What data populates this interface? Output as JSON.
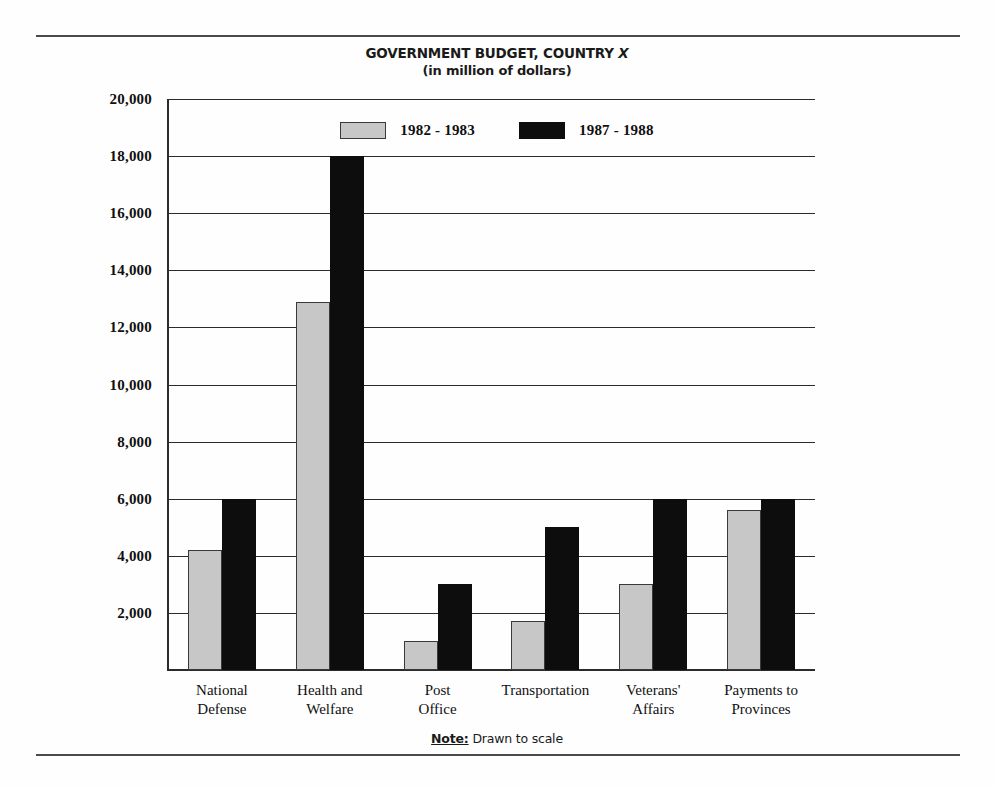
{
  "figure": {
    "title": "GOVERNMENT BUDGET, COUNTRY ",
    "title_variable": "X",
    "subtitle": "(in million of dollars)",
    "note_key": "Note:",
    "note_text": " Drawn to scale"
  },
  "colors": {
    "series_1982_1983": "#c7c7c7",
    "series_1987_1988": "#0d0d0d",
    "axis": "#2b2b2b",
    "rule": "#4a4a4a",
    "text": "#101010",
    "background": "#fefefe"
  },
  "legend": {
    "position": "top-center",
    "entries": [
      {
        "label": "1982 - 1983",
        "color": "#c7c7c7"
      },
      {
        "label": "1987 - 1988",
        "color": "#0d0d0d"
      }
    ]
  },
  "chart_data": {
    "type": "bar",
    "title": "GOVERNMENT BUDGET, COUNTRY X",
    "subtitle": "(in million of dollars)",
    "xlabel": "",
    "ylabel": "",
    "ylim": [
      0,
      20000
    ],
    "ytick_step": 2000,
    "grid": true,
    "legend_position": "top-center",
    "note": "Note: Drawn to scale",
    "units": "million of dollars",
    "categories": [
      "National Defense",
      "Health and Welfare",
      "Post Office",
      "Transportation",
      "Veterans' Affairs",
      "Payments to Provinces"
    ],
    "category_lines": [
      [
        "National",
        "Defense"
      ],
      [
        "Health and",
        "Welfare"
      ],
      [
        "Post",
        "Office"
      ],
      [
        "Transportation",
        ""
      ],
      [
        "Veterans'",
        "Affairs"
      ],
      [
        "Payments to",
        "Provinces"
      ]
    ],
    "yticks": [
      "20,000",
      "18,000",
      "16,000",
      "14,000",
      "12,000",
      "10,000",
      "8,000",
      "6,000",
      "4,000",
      "2,000"
    ],
    "ytick_values": [
      20000,
      18000,
      16000,
      14000,
      12000,
      10000,
      8000,
      6000,
      4000,
      2000
    ],
    "series": [
      {
        "name": "1982 - 1983",
        "color": "#c7c7c7",
        "values": [
          4200,
          12900,
          1000,
          1700,
          3000,
          5600
        ]
      },
      {
        "name": "1987 - 1988",
        "color": "#0d0d0d",
        "values": [
          6000,
          18000,
          3000,
          5000,
          6000,
          6000
        ]
      }
    ]
  }
}
